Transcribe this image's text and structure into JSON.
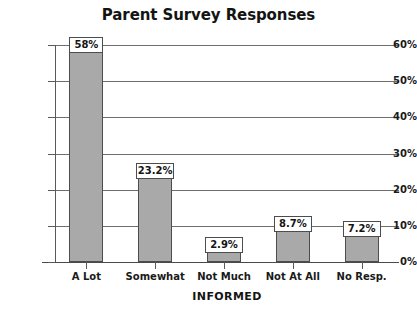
{
  "chart_data": {
    "type": "bar",
    "title": "Parent Survey Responses",
    "xlabel": "INFORMED",
    "ylabel": "",
    "categories": [
      "A Lot",
      "Somewhat",
      "Not Much",
      "Not At All",
      "No Resp."
    ],
    "values": [
      58,
      23.2,
      2.9,
      8.7,
      7.2
    ],
    "value_labels": [
      "58%",
      "23.2%",
      "2.9%",
      "8.7%",
      "7.2%"
    ],
    "ylim": [
      0,
      60
    ],
    "y_ticks": [
      0,
      10,
      20,
      30,
      40,
      50,
      60
    ],
    "y_tick_labels": [
      "0%",
      "10%",
      "20%",
      "30%",
      "40%",
      "50%",
      "60%"
    ],
    "grid": true,
    "legend": false,
    "bar_color": "#a9a9a9",
    "bar_border_color": "#4d4d4d",
    "grid_color": "#6e6e6e",
    "axis_color": "#4a4a4a",
    "text_color": "#141414"
  }
}
